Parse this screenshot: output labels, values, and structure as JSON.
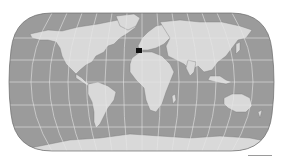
{
  "map": {
    "projection": "pseudo-cylindrical world (Robinson-like)",
    "colors": {
      "ocean": "#9b9b9b",
      "land": "#d9d9d9",
      "graticule": "#e6e6e6",
      "border": "#6a6a6a",
      "highlight": "#111111",
      "background": "#ffffff"
    },
    "highlight_region": "Iberian Peninsula",
    "graticule": {
      "parallels_deg": [
        -60,
        -30,
        0,
        30,
        60
      ],
      "meridian_spacing_deg": 30
    }
  }
}
